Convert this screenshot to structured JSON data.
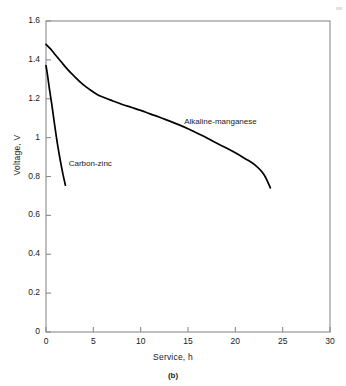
{
  "figure": {
    "caption": "(b)",
    "speck_name": "scan-artifact"
  },
  "chart_data": {
    "type": "line",
    "title": "",
    "xlabel": "Service, h",
    "ylabel": "Voltage, V",
    "xlim": [
      0,
      30
    ],
    "ylim": [
      0,
      1.6
    ],
    "xticks": [
      0,
      5,
      10,
      15,
      20,
      25,
      30
    ],
    "xtick_labels": [
      "0",
      "5",
      "10",
      "15",
      "20",
      "25",
      "30"
    ],
    "yticks": [
      0,
      0.2,
      0.4,
      0.6,
      0.8,
      1.0,
      1.2,
      1.4,
      1.6
    ],
    "ytick_labels": [
      "0",
      "0.2",
      "0.4",
      "0.6",
      "0.8",
      "1",
      "1.2",
      "1.4",
      "1.6"
    ],
    "grid": false,
    "legend_position": "inline-annotations",
    "line_color": "#000000",
    "axis_color": "#8a8a8a",
    "series": [
      {
        "name": "Alkaline-manganese",
        "label": "Alkaline-manganese",
        "label_x": 14.6,
        "label_y": 1.075,
        "x": [
          0.0,
          0.5,
          1.0,
          1.6,
          2.3,
          3.0,
          3.8,
          4.6,
          5.4,
          6.2,
          7.0,
          8.0,
          9.0,
          10.0,
          11.0,
          12.0,
          13.0,
          14.0,
          15.0,
          16.0,
          17.0,
          18.0,
          19.0,
          20.0,
          21.0,
          22.0,
          23.0,
          23.7
        ],
        "y": [
          1.48,
          1.455,
          1.425,
          1.39,
          1.35,
          1.315,
          1.278,
          1.248,
          1.222,
          1.205,
          1.19,
          1.172,
          1.156,
          1.14,
          1.122,
          1.105,
          1.086,
          1.067,
          1.046,
          1.022,
          0.998,
          0.972,
          0.948,
          0.922,
          0.893,
          0.862,
          0.812,
          0.742
        ]
      },
      {
        "name": "Carbon-zinc",
        "label": "Carbon-zinc",
        "label_x": 2.4,
        "label_y": 0.86,
        "x": [
          0.0,
          0.15,
          0.35,
          0.6,
          0.9,
          1.2,
          1.5,
          1.8,
          2.05
        ],
        "y": [
          1.37,
          1.325,
          1.255,
          1.175,
          1.07,
          0.97,
          0.885,
          0.81,
          0.755
        ]
      }
    ]
  }
}
